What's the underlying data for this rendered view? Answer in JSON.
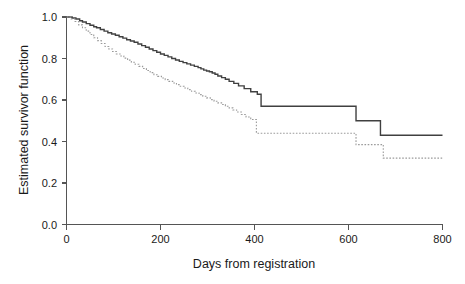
{
  "chart_data": {
    "type": "line",
    "title": "",
    "subtitle": "",
    "xlabel": "Days from registration",
    "ylabel": "Estimated survivor function",
    "xlim": [
      0,
      800
    ],
    "ylim": [
      0.0,
      1.0
    ],
    "xticks": [
      0,
      200,
      400,
      600,
      800
    ],
    "xtick_labels": [
      "0",
      "200",
      "400",
      "600",
      "800"
    ],
    "yticks": [
      0.0,
      0.2,
      0.4,
      0.6,
      0.8,
      1.0
    ],
    "ytick_labels": [
      "0.0",
      "0.2",
      "0.4",
      "0.6",
      "0.8",
      "1.0"
    ],
    "grid": false,
    "legend": "none",
    "step_style": "post",
    "series": [
      {
        "name": "Group 1 (solid)",
        "style": "solid",
        "color": "#404040",
        "final_value": 0.43,
        "x": [
          0,
          12,
          20,
          28,
          34,
          42,
          50,
          58,
          64,
          72,
          80,
          88,
          96,
          104,
          112,
          120,
          128,
          136,
          144,
          152,
          160,
          168,
          176,
          184,
          192,
          200,
          208,
          216,
          224,
          232,
          240,
          248,
          256,
          264,
          272,
          280,
          286,
          292,
          298,
          304,
          310,
          316,
          322,
          330,
          338,
          346,
          356,
          366,
          378,
          392,
          406,
          414,
          612,
          616,
          662,
          668,
          800
        ],
        "y": [
          1.0,
          0.995,
          0.99,
          0.982,
          0.976,
          0.968,
          0.96,
          0.953,
          0.948,
          0.94,
          0.932,
          0.924,
          0.918,
          0.912,
          0.905,
          0.898,
          0.89,
          0.884,
          0.878,
          0.87,
          0.862,
          0.854,
          0.846,
          0.838,
          0.83,
          0.822,
          0.815,
          0.808,
          0.8,
          0.793,
          0.786,
          0.78,
          0.774,
          0.768,
          0.762,
          0.756,
          0.75,
          0.744,
          0.74,
          0.736,
          0.73,
          0.724,
          0.716,
          0.708,
          0.7,
          0.69,
          0.68,
          0.668,
          0.655,
          0.64,
          0.628,
          0.57,
          0.57,
          0.5,
          0.5,
          0.43,
          0.43
        ]
      },
      {
        "name": "Group 2 (dashed)",
        "style": "dashed",
        "color": "#9a9a9a",
        "final_value": 0.32,
        "x": [
          0,
          10,
          18,
          26,
          34,
          42,
          50,
          58,
          66,
          74,
          82,
          90,
          98,
          106,
          114,
          122,
          130,
          138,
          146,
          154,
          162,
          170,
          178,
          186,
          194,
          202,
          210,
          218,
          226,
          234,
          242,
          250,
          258,
          266,
          274,
          282,
          290,
          298,
          306,
          314,
          322,
          330,
          338,
          346,
          354,
          362,
          372,
          382,
          392,
          404,
          612,
          616,
          668,
          674,
          800
        ],
        "y": [
          1.0,
          0.99,
          0.978,
          0.962,
          0.948,
          0.932,
          0.916,
          0.9,
          0.886,
          0.872,
          0.858,
          0.846,
          0.834,
          0.822,
          0.812,
          0.802,
          0.792,
          0.782,
          0.772,
          0.762,
          0.752,
          0.742,
          0.732,
          0.722,
          0.714,
          0.706,
          0.698,
          0.69,
          0.682,
          0.674,
          0.666,
          0.658,
          0.65,
          0.642,
          0.634,
          0.626,
          0.618,
          0.61,
          0.602,
          0.594,
          0.586,
          0.578,
          0.57,
          0.562,
          0.552,
          0.542,
          0.53,
          0.518,
          0.506,
          0.44,
          0.44,
          0.385,
          0.385,
          0.32,
          0.32
        ]
      }
    ]
  },
  "axes": {
    "x_title": "Days from registration",
    "y_title": "Estimated survivor function"
  },
  "colors": {
    "axis": "#555555",
    "text": "#1a1a1a",
    "series_solid": "#404040",
    "series_dashed": "#9a9a9a",
    "background": "#ffffff"
  }
}
